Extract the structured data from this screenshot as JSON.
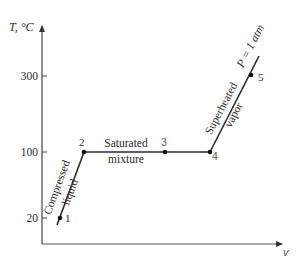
{
  "diagram": {
    "type": "T-v diagram",
    "y_axis": {
      "label": "T, °C",
      "ticks": [
        {
          "value": "300",
          "y": 76
        },
        {
          "value": "100",
          "y": 152
        },
        {
          "value": "20",
          "y": 218
        }
      ]
    },
    "x_axis": {
      "label": "v"
    },
    "points": [
      {
        "id": "1",
        "label": "1",
        "T": 20
      },
      {
        "id": "2",
        "label": "2",
        "T": 100
      },
      {
        "id": "3",
        "label": "3",
        "T": 100
      },
      {
        "id": "4",
        "label": "4",
        "T": 100
      },
      {
        "id": "5",
        "label": "5",
        "T": 300
      }
    ],
    "regions": {
      "compressed": {
        "line1": "Compressed",
        "line2": "liquid"
      },
      "saturated": {
        "line1": "Saturated",
        "line2": "mixture"
      },
      "superheated": {
        "line1": "Superheated",
        "line2": "vapor"
      }
    },
    "pressure_label": "P = 1 atm",
    "colors": {
      "line": "#2a2a2a",
      "axis": "#555555"
    }
  }
}
